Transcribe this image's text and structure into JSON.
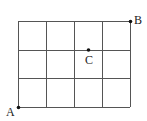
{
  "diagram": {
    "type": "grid",
    "columns": 4,
    "rows": 3,
    "line_color": "#555555",
    "grid": {
      "left": 18,
      "top": 21,
      "right": 130,
      "bottom": 107
    },
    "points": [
      {
        "label": "A",
        "x": 18,
        "y": 107,
        "label_x": 4,
        "label_y": 106
      },
      {
        "label": "B",
        "x": 130,
        "y": 21,
        "label_x": 134,
        "label_y": 14
      },
      {
        "label": "C",
        "x": 88,
        "y": 50,
        "label_x": 84,
        "label_y": 54
      }
    ]
  }
}
